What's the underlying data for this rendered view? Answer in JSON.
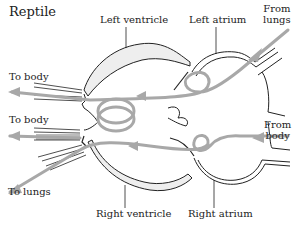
{
  "diagram": {
    "title": "Reptile",
    "labels": {
      "left_ventricle": "Left ventricle",
      "left_atrium": "Left atrium",
      "from_lungs_1": "From",
      "from_lungs_2": "lungs",
      "to_body_upper": "To body",
      "to_body_lower": "To body",
      "from_body_1": "From",
      "from_body_2": "body",
      "to_lungs": "To lungs",
      "right_ventricle": "Right ventricle",
      "right_atrium": "Right atrium"
    },
    "colors": {
      "outline": "#222222",
      "fill": "#eeeeee",
      "flow_arrow": "#a8a8a8"
    },
    "truncated_caption": "Five-chambered reptile heart"
  }
}
